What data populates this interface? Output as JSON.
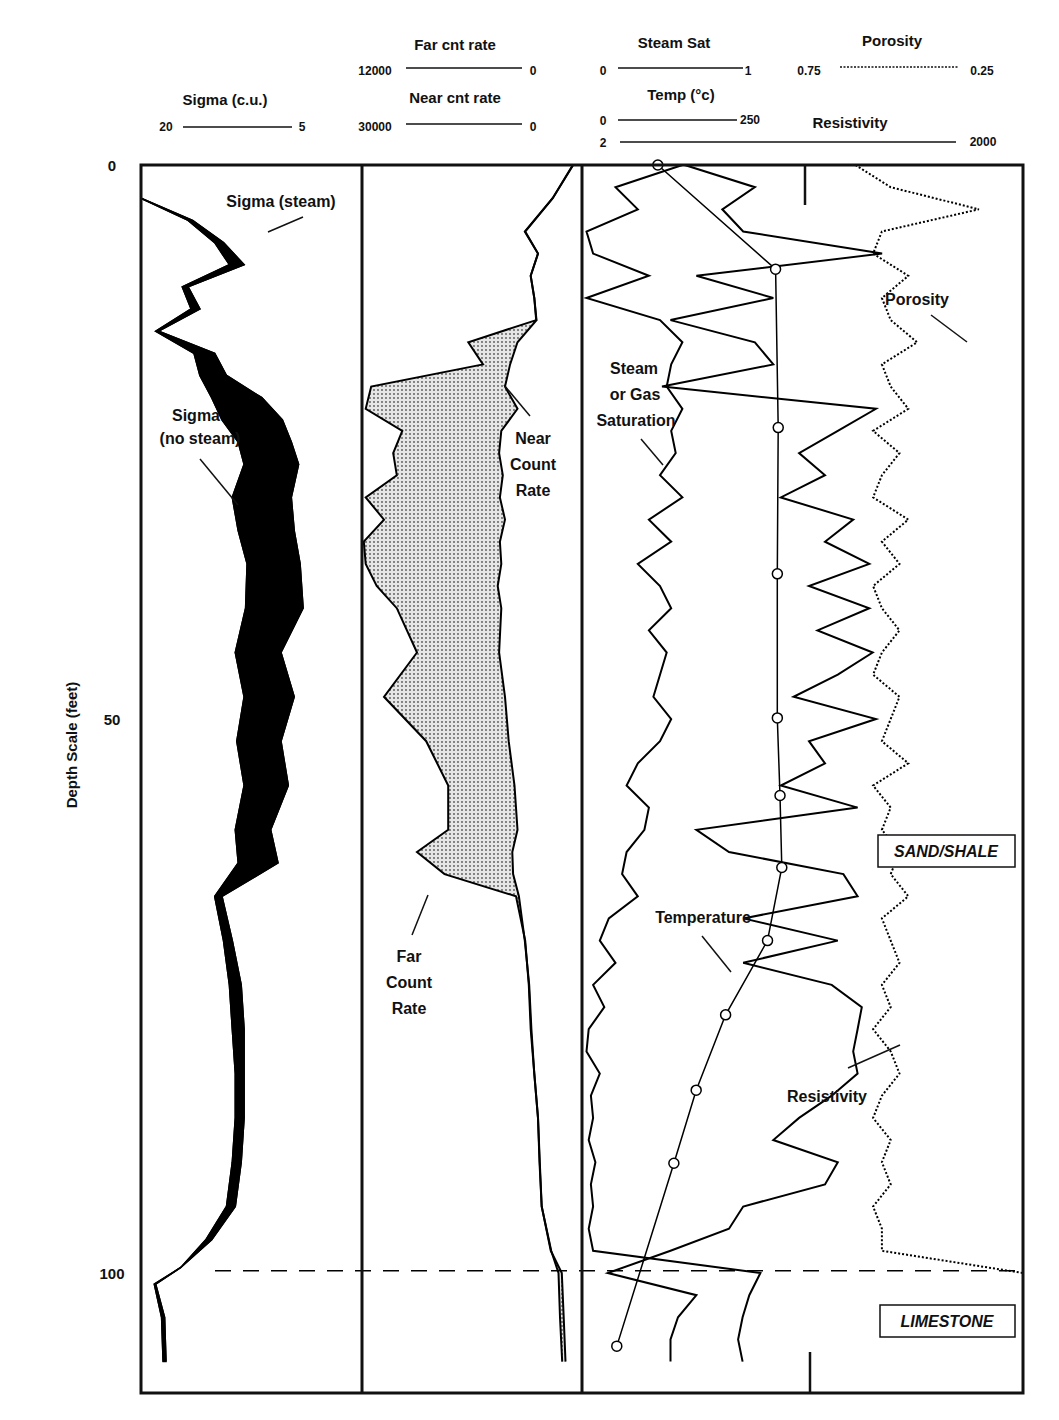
{
  "chart_data": {
    "type": "line",
    "title": "",
    "ylabel": "Depth Scale (feet)",
    "ylim": [
      0,
      108
    ],
    "y_ticks": [
      "0",
      "50",
      "100"
    ],
    "y_tick_values": [
      0,
      50,
      100
    ],
    "grid": false,
    "headers": {
      "track1": [
        {
          "name": "Sigma (c.u.)",
          "left": "20",
          "right": "5",
          "style": "solid"
        }
      ],
      "track2": [
        {
          "name": "Far cnt rate",
          "left": "12000",
          "right": "0",
          "style": "solid"
        },
        {
          "name": "Near cnt rate",
          "left": "30000",
          "right": "0",
          "style": "solid"
        }
      ],
      "track3a": [
        {
          "name": "Steam Sat",
          "left": "0",
          "right": "1",
          "style": "solid"
        },
        {
          "name": "Temp (°c)",
          "left": "0",
          "right": "250",
          "style": "solid"
        }
      ],
      "track3b": [
        {
          "name": "Porosity",
          "left": "0.75",
          "right": "0.25",
          "style": "dotted"
        },
        {
          "name": "Resistivity",
          "left": "2",
          "right": "2000",
          "style": "solid"
        }
      ]
    },
    "annotations": {
      "sigma_steam": "Sigma (steam)",
      "sigma_nosteam_1": "Sigma",
      "sigma_nosteam_2": "(no steam)",
      "near_1": "Near",
      "near_2": "Count",
      "near_3": "Rate",
      "far_1": "Far",
      "far_2": "Count",
      "far_3": "Rate",
      "steam_1": "Steam",
      "steam_2": "or Gas",
      "steam_3": "Saturation",
      "porosity": "Porosity",
      "temperature": "Temperature",
      "resistivity": "Resistivity",
      "sand_shale": "SAND/SHALE",
      "limestone": "LIMESTONE"
    },
    "boundaries": [
      {
        "name": "sand-shale top",
        "depth": 61.5
      },
      {
        "name": "limestone top",
        "depth": 99.8
      }
    ],
    "series": [
      {
        "name": "Temperature",
        "unit": "°C",
        "range": [
          0,
          250
        ],
        "marker": "circle",
        "depth": [
          0,
          9.4,
          23.7,
          36.9,
          49.9,
          56.9,
          63.4,
          70.0,
          76.7,
          83.5,
          90.1,
          106.6
        ],
        "values": [
          85,
          217,
          220,
          219,
          219,
          222,
          224,
          208,
          161,
          128,
          103,
          39
        ]
      },
      {
        "name": "Sigma (steam)",
        "unit": "c.u.",
        "range": [
          20,
          5
        ],
        "depth": [
          3,
          5,
          7,
          9,
          11,
          13,
          15,
          17,
          19,
          21,
          23,
          25,
          27,
          30,
          33,
          36,
          40,
          44,
          48,
          52,
          56,
          60,
          63,
          66,
          70,
          74,
          78,
          82,
          86,
          90,
          94,
          97,
          99.5,
          101,
          104,
          108
        ],
        "values": [
          20,
          16.5,
          14.4,
          13.0,
          16.8,
          16.0,
          18.8,
          15.0,
          14.2,
          11.8,
          10.4,
          9.8,
          9.3,
          9.8,
          9.6,
          9.2,
          9.0,
          10.5,
          9.6,
          10.5,
          10.0,
          11.2,
          10.7,
          14.5,
          13.8,
          13.2,
          13.0,
          13.0,
          13.0,
          13.2,
          13.6,
          15.2,
          17.3,
          19.1,
          18.6,
          18.5
        ]
      },
      {
        "name": "Sigma (no steam)",
        "unit": "c.u.",
        "range": [
          20,
          5
        ],
        "depth": [
          3,
          5,
          7,
          9,
          11,
          13,
          15,
          17,
          19,
          21,
          23,
          25,
          27,
          30,
          33,
          36,
          40,
          44,
          48,
          52,
          56,
          60,
          63,
          66,
          70,
          74,
          78,
          82,
          86,
          90,
          94,
          97,
          99.5,
          101,
          104,
          108
        ],
        "values": [
          20,
          16.8,
          15.0,
          14.0,
          17.2,
          16.6,
          19.0,
          16.4,
          16.0,
          15.2,
          14.5,
          13.4,
          13.0,
          13.8,
          13.4,
          12.8,
          12.9,
          13.6,
          13.0,
          13.5,
          13.0,
          13.6,
          13.4,
          15.0,
          14.4,
          14.0,
          13.8,
          13.6,
          13.6,
          13.8,
          14.2,
          15.6,
          17.3,
          19.0,
          18.4,
          18.3
        ]
      },
      {
        "name": "Near Count Rate",
        "range": [
          30000,
          0
        ],
        "depth": [
          0,
          3,
          6,
          8,
          10,
          12,
          14,
          16,
          18,
          20,
          22,
          24,
          26,
          28,
          30,
          32,
          34,
          36,
          38,
          40,
          44,
          48,
          52,
          56,
          60,
          62,
          64,
          66,
          70,
          74,
          78,
          82,
          86,
          90,
          94,
          98,
          100,
          104,
          108
        ],
        "values": [
          1200,
          4000,
          7800,
          6000,
          7000,
          6500,
          6200,
          8800,
          9800,
          10500,
          8800,
          11000,
          11300,
          10800,
          11200,
          10500,
          11200,
          11000,
          11500,
          11000,
          11300,
          10500,
          10000,
          9200,
          8800,
          9500,
          9400,
          8600,
          7800,
          7200,
          6900,
          6500,
          6000,
          5800,
          5500,
          4200,
          3200,
          3000,
          2700
        ]
      },
      {
        "name": "Far Count Rate",
        "range": [
          12000,
          0
        ],
        "depth": [
          0,
          3,
          6,
          8,
          10,
          12,
          14,
          16,
          18,
          20,
          22,
          24,
          26,
          28,
          30,
          32,
          34,
          36,
          38,
          40,
          44,
          48,
          52,
          56,
          60,
          62,
          64,
          66,
          70,
          74,
          78,
          82,
          86,
          90,
          94,
          98,
          100,
          104,
          108
        ],
        "values": [
          500,
          1600,
          3100,
          2400,
          2800,
          2600,
          2500,
          6200,
          5400,
          11500,
          11800,
          9800,
          10300,
          10100,
          11800,
          10800,
          11900,
          11800,
          11200,
          10100,
          9000,
          10800,
          8500,
          7300,
          7300,
          9000,
          7500,
          3600,
          3100,
          2900,
          2800,
          2600,
          2400,
          2300,
          2200,
          1700,
          1100,
          1000,
          900
        ]
      },
      {
        "name": "Steam or Gas Saturation",
        "range": [
          0,
          1
        ],
        "depth": [
          0,
          2,
          4,
          6,
          8,
          10,
          12,
          14,
          16,
          18,
          20,
          22,
          24,
          26,
          28,
          30,
          32,
          34,
          36,
          38,
          40,
          42,
          44,
          46,
          48,
          50,
          52,
          54,
          56,
          58,
          60,
          62,
          64,
          66,
          68,
          70,
          72,
          74,
          76,
          78,
          80,
          82,
          84,
          86,
          88,
          90,
          92,
          94,
          96,
          98,
          100,
          102,
          104,
          106,
          108
        ],
        "values": [
          0.45,
          0.15,
          0.25,
          0.02,
          0.05,
          0.3,
          0.02,
          0.35,
          0.45,
          0.4,
          0.38,
          0.45,
          0.4,
          0.42,
          0.35,
          0.45,
          0.3,
          0.4,
          0.25,
          0.35,
          0.4,
          0.3,
          0.38,
          0.35,
          0.32,
          0.4,
          0.35,
          0.25,
          0.2,
          0.3,
          0.28,
          0.2,
          0.18,
          0.25,
          0.12,
          0.08,
          0.15,
          0.05,
          0.1,
          0.03,
          0.02,
          0.08,
          0.04,
          0.05,
          0.03,
          0.06,
          0.04,
          0.05,
          0.03,
          0.05,
          0.8,
          0.75,
          0.72,
          0.7,
          0.72
        ]
      },
      {
        "name": "Resistivity",
        "range": [
          2,
          2000
        ],
        "scale": "log",
        "depth": [
          0,
          2,
          4,
          6,
          8,
          10,
          12,
          14,
          16,
          18,
          20,
          22,
          24,
          26,
          28,
          30,
          32,
          34,
          36,
          38,
          40,
          42,
          44,
          46,
          48,
          50,
          52,
          54,
          56,
          58,
          60,
          62,
          64,
          66,
          68,
          70,
          72,
          74,
          76,
          78,
          80,
          82,
          84,
          86,
          88,
          90,
          92,
          94,
          96,
          98,
          100,
          102,
          104,
          106,
          108
        ],
        "values": [
          10,
          30,
          18,
          25,
          220,
          12,
          40,
          8,
          30,
          40,
          7,
          200,
          110,
          60,
          90,
          45,
          140,
          90,
          180,
          70,
          180,
          80,
          190,
          110,
          55,
          200,
          70,
          90,
          45,
          150,
          12,
          20,
          120,
          150,
          25,
          110,
          25,
          100,
          160,
          150,
          140,
          150,
          100,
          60,
          40,
          110,
          90,
          25,
          20,
          8,
          3,
          12,
          9,
          8,
          8
        ]
      },
      {
        "name": "Porosity",
        "range": [
          0.75,
          0.25
        ],
        "style": "dotted",
        "depth": [
          0,
          2,
          4,
          6,
          8,
          10,
          12,
          14,
          16,
          18,
          20,
          22,
          24,
          26,
          28,
          30,
          32,
          34,
          36,
          38,
          40,
          42,
          44,
          46,
          48,
          50,
          52,
          54,
          56,
          58,
          60,
          62,
          64,
          66,
          68,
          70,
          72,
          74,
          76,
          78,
          80,
          82,
          84,
          86,
          88,
          90,
          92,
          94,
          96,
          98,
          100,
          102,
          104,
          106,
          108
        ],
        "values": [
          0.44,
          0.4,
          0.3,
          0.41,
          0.42,
          0.38,
          0.41,
          0.4,
          0.37,
          0.41,
          0.4,
          0.38,
          0.42,
          0.39,
          0.41,
          0.42,
          0.38,
          0.41,
          0.39,
          0.42,
          0.41,
          0.39,
          0.41,
          0.42,
          0.39,
          0.4,
          0.41,
          0.38,
          0.42,
          0.4,
          0.41,
          0.39,
          0.4,
          0.38,
          0.41,
          0.4,
          0.39,
          0.41,
          0.4,
          0.42,
          0.4,
          0.39,
          0.41,
          0.42,
          0.4,
          0.41,
          0.4,
          0.42,
          0.41,
          0.41,
          0.25,
          0.25,
          0.25,
          0.25,
          0.25
        ]
      }
    ]
  }
}
